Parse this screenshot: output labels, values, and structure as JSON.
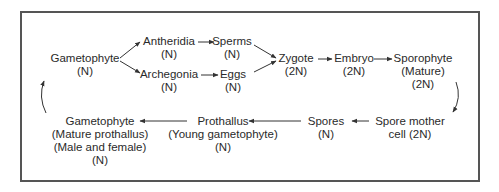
{
  "diagram": {
    "nodes": {
      "gametophyte_top": {
        "label": "Gametophyte",
        "ploidy": "(N)"
      },
      "antheridia": {
        "label": "Antheridia",
        "ploidy": "(N)"
      },
      "sperms": {
        "label": "Sperms",
        "ploidy": "(N)"
      },
      "archegonia": {
        "label": "Archegonia",
        "ploidy": "(N)"
      },
      "eggs": {
        "label": "Eggs",
        "ploidy": "(N)"
      },
      "zygote": {
        "label": "Zygote",
        "ploidy": "(2N)"
      },
      "embryo": {
        "label": "Embryo",
        "ploidy": "(2N)"
      },
      "sporophyte": {
        "label": "Sporophyte",
        "sub": "(Mature)",
        "ploidy": "(2N)"
      },
      "spore_mother_cell": {
        "label": "Spore mother",
        "sub": "cell (2N)"
      },
      "spores": {
        "label": "Spores",
        "ploidy": "(N)"
      },
      "prothallus": {
        "label": "Prothallus",
        "sub": "(Young gametophyte)",
        "ploidy": "(N)"
      },
      "gametophyte_bottom": {
        "label": "Gametophyte",
        "sub": "(Mature prothallus)",
        "sub2": "(Male and female)",
        "ploidy": "(N)"
      }
    },
    "edges": [
      [
        "Gametophyte",
        "Antheridia"
      ],
      [
        "Gametophyte",
        "Archegonia"
      ],
      [
        "Antheridia",
        "Sperms"
      ],
      [
        "Archegonia",
        "Eggs"
      ],
      [
        "Sperms",
        "Zygote"
      ],
      [
        "Eggs",
        "Zygote"
      ],
      [
        "Zygote",
        "Embryo"
      ],
      [
        "Embryo",
        "Sporophyte"
      ],
      [
        "Sporophyte",
        "Spore mother cell"
      ],
      [
        "Spore mother cell",
        "Spores"
      ],
      [
        "Spores",
        "Prothallus"
      ],
      [
        "Prothallus",
        "Gametophyte (Mature prothallus)"
      ],
      [
        "Gametophyte (Mature prothallus)",
        "Gametophyte"
      ]
    ],
    "colors": {
      "text": "#2a2a2a",
      "border": "#555555",
      "arrow": "#333333"
    }
  }
}
